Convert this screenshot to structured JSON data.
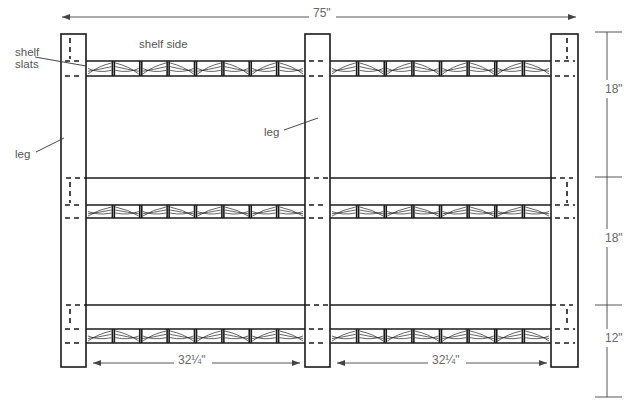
{
  "diagram": {
    "labels": {
      "shelf_side": "shelf side",
      "shelf_slats": "shelf\nslats",
      "leg_left": "leg",
      "leg_middle": "leg"
    },
    "dimensions": {
      "overall_width": "75\"",
      "bay_width_left": "32¼\"",
      "bay_width_right": "32¼\"",
      "upper_spacing": "18\"",
      "middle_spacing": "18\"",
      "lower_spacing": "12\""
    },
    "structure": {
      "legs": 3,
      "shelves": 3,
      "bays": 2,
      "slats_per_bay": 8
    }
  }
}
